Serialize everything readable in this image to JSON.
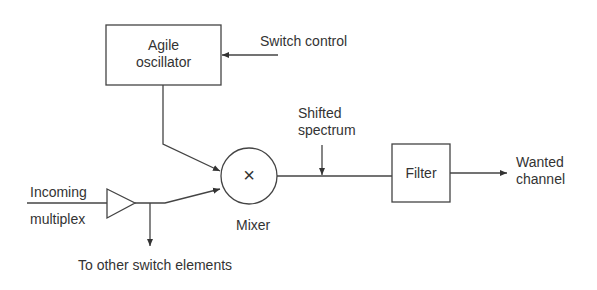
{
  "diagram": {
    "blocks": {
      "oscillator": {
        "line1": "Agile",
        "line2": "oscillator"
      },
      "filter": {
        "label": "Filter"
      },
      "mixer": {
        "symbol": "×",
        "label": "Mixer"
      }
    },
    "labels": {
      "switch_control": "Switch control",
      "shifted_spectrum_1": "Shifted",
      "shifted_spectrum_2": "spectrum",
      "wanted_channel_1": "Wanted",
      "wanted_channel_2": "channel",
      "incoming_1": "Incoming",
      "incoming_2": "multiplex",
      "other_elements": "To other switch elements"
    },
    "colors": {
      "stroke": "#444444",
      "background": "#ffffff"
    }
  }
}
